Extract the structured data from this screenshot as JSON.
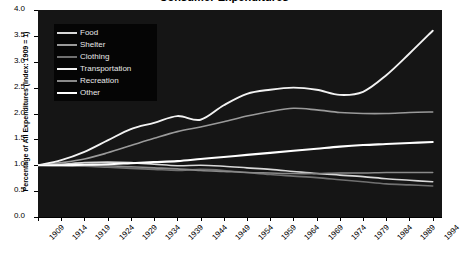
{
  "chart_data": {
    "type": "line",
    "title": "Consumer Expenditures",
    "xlabel": "",
    "ylabel": "Percentage of All Expenditures (Index: 1909 = 1)",
    "xlim": [
      1909,
      1996
    ],
    "ylim": [
      0.0,
      4.0
    ],
    "grid": false,
    "legend_position": "upper-left-inside",
    "y_ticks": [
      "0.0",
      "0.5",
      "1.0",
      "1.5",
      "2.0",
      "2.5",
      "3.0",
      "3.5",
      "4.0"
    ],
    "y_tick_values": [
      0.0,
      0.5,
      1.0,
      1.5,
      2.0,
      2.5,
      3.0,
      3.5,
      4.0
    ],
    "x_ticks": [
      "1909",
      "1914",
      "1919",
      "1924",
      "1929",
      "1934",
      "1939",
      "1944",
      "1949",
      "1954",
      "1959",
      "1964",
      "1969",
      "1974",
      "1979",
      "1984",
      "1989",
      "1994"
    ],
    "x_tick_values": [
      1909,
      1914,
      1919,
      1924,
      1929,
      1934,
      1939,
      1944,
      1949,
      1954,
      1959,
      1964,
      1969,
      1974,
      1979,
      1984,
      1989,
      1994
    ],
    "x": [
      1909,
      1914,
      1919,
      1924,
      1929,
      1934,
      1939,
      1944,
      1949,
      1954,
      1959,
      1964,
      1969,
      1974,
      1979,
      1984,
      1989,
      1994
    ],
    "series": [
      {
        "name": "Food",
        "color": "#d8d8d8",
        "width": 1.6,
        "values": [
          1.0,
          1.02,
          1.05,
          1.06,
          1.05,
          1.02,
          0.99,
          1.0,
          0.98,
          0.95,
          0.92,
          0.88,
          0.84,
          0.81,
          0.78,
          0.74,
          0.71,
          0.68
        ]
      },
      {
        "name": "Shelter",
        "color": "#9a9a9a",
        "width": 1.6,
        "values": [
          1.0,
          1.05,
          1.12,
          1.24,
          1.38,
          1.52,
          1.65,
          1.74,
          1.84,
          1.95,
          2.04,
          2.1,
          2.07,
          2.02,
          2.0,
          2.0,
          2.02,
          2.03
        ]
      },
      {
        "name": "Clothing",
        "color": "#707070",
        "width": 1.6,
        "values": [
          1.0,
          0.99,
          0.98,
          0.96,
          0.94,
          0.92,
          0.9,
          0.92,
          0.9,
          0.86,
          0.82,
          0.79,
          0.76,
          0.72,
          0.68,
          0.64,
          0.62,
          0.6
        ]
      },
      {
        "name": "Transportation",
        "color": "#f2f2f2",
        "width": 1.9,
        "values": [
          1.0,
          1.1,
          1.26,
          1.48,
          1.7,
          1.82,
          1.95,
          1.88,
          2.16,
          2.38,
          2.46,
          2.5,
          2.46,
          2.36,
          2.42,
          2.74,
          3.16,
          3.6
        ]
      },
      {
        "name": "Recreation",
        "color": "#8a8a8a",
        "width": 1.6,
        "values": [
          1.0,
          1.0,
          1.0,
          0.99,
          0.97,
          0.95,
          0.93,
          0.9,
          0.88,
          0.86,
          0.85,
          0.84,
          0.84,
          0.85,
          0.85,
          0.86,
          0.86,
          0.86
        ]
      },
      {
        "name": "Other",
        "color": "#ffffff",
        "width": 2.1,
        "values": [
          1.0,
          1.0,
          1.01,
          1.02,
          1.04,
          1.06,
          1.08,
          1.12,
          1.16,
          1.2,
          1.24,
          1.28,
          1.32,
          1.36,
          1.39,
          1.41,
          1.43,
          1.45
        ]
      }
    ]
  }
}
